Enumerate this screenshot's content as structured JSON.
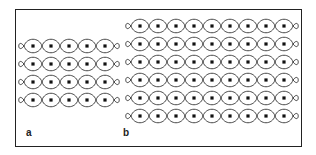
{
  "figure": {
    "panels": [
      {
        "label": "a",
        "rows": 4,
        "cols": 5,
        "origin_x": 33,
        "origin_y": 46,
        "spacing": 18,
        "label_x": 26,
        "label_y": 127
      },
      {
        "label": "b",
        "rows": 6,
        "cols": 9,
        "origin_x": 140,
        "origin_y": 26,
        "spacing": 18,
        "label_x": 123,
        "label_y": 127
      }
    ],
    "colors": {
      "line": "#333333",
      "dot": "#111111",
      "frame": "#222222"
    }
  }
}
